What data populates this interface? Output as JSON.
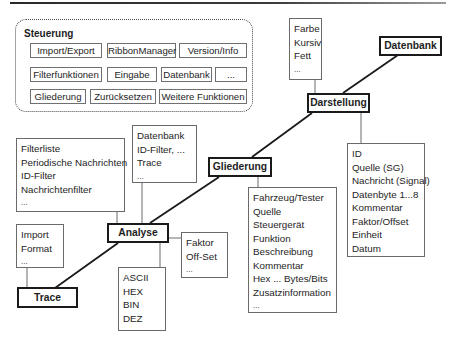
{
  "steuerung": {
    "label": "Steuerung",
    "rows": [
      [
        "Import/Export",
        "RibbonManager",
        "Version/Info"
      ],
      [
        "Filterfunktionen",
        "Eingabe",
        "Datenbank",
        "..."
      ],
      [
        "Gliederung",
        "Zurücksetzen",
        "Weitere Funktionen"
      ]
    ]
  },
  "nodes": {
    "datenbank": "Datenbank",
    "darstellung": "Darstellung",
    "gliederung": "Gliederung",
    "analyse": "Analyse",
    "trace": "Trace"
  },
  "lists": {
    "darstellung_format": [
      "Farbe",
      "Kursiv",
      "Fett",
      "..."
    ],
    "darstellung_fields": [
      "ID",
      "Quelle (SG)",
      "Nachricht (Signal)",
      "Datenbyte 1...8",
      "Kommentar",
      "Faktor/Offset",
      "Einheit",
      "Datum"
    ],
    "gliederung_fields": [
      "Fahrzeug/Tester",
      "Quelle",
      "Steuergerät",
      "Funktion",
      "Beschreibung",
      "Kommentar",
      "Hex ... Bytes/Bits",
      "Zusatzinformation",
      "..."
    ],
    "analyse_filter": [
      "Filterliste",
      "Periodische Nachrichten",
      "ID-Filter",
      "Nachrichtenfilter",
      "..."
    ],
    "analyse_sources": [
      "Datenbank",
      "ID-Filter, ...",
      "Trace",
      "..."
    ],
    "analyse_scaling": [
      "Faktor",
      "Off-Set",
      "..."
    ],
    "analyse_formats": [
      "ASCII",
      "HEX",
      "BIN",
      "DEZ"
    ],
    "trace_import": [
      "Import",
      "Format",
      "..."
    ]
  },
  "colors": {
    "line": "#1a1a1a",
    "connector": "#6a6a6a",
    "box_border": "#6a6a6a"
  }
}
